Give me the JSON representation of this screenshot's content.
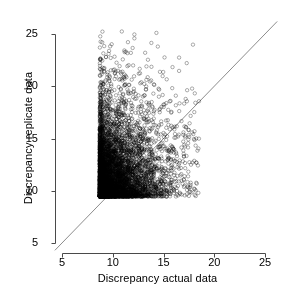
{
  "chart_data": {
    "type": "scatter",
    "title": "",
    "xlabel": "Discrepancy actual data",
    "ylabel": "Discrepancy replicate data",
    "xlim": [
      5,
      25
    ],
    "ylim": [
      5,
      25
    ],
    "xticks": [
      5,
      10,
      15,
      20,
      25
    ],
    "yticks": [
      5,
      10,
      15,
      20,
      25
    ],
    "xticklabels": [
      "5",
      "10",
      "15",
      "20",
      "25"
    ],
    "yticklabels": [
      "5",
      "10",
      "15",
      "20",
      "25"
    ],
    "grid": false,
    "legend": null,
    "marker": {
      "style": "open-circle",
      "radius_px": 1.7,
      "color": "#000000",
      "line_width": 0.6,
      "opacity": 0.55
    },
    "n_points": 6000,
    "point_cloud": {
      "description": "Dense right-skewed bivariate cloud of posterior predictive discrepancy draws",
      "x_center": 10.6,
      "y_center": 12.1,
      "x_sd": 1.85,
      "y_sd": 2.55,
      "correlation": 0.12,
      "x_skew": 0.85,
      "y_skew": 0.75,
      "x_range": [
        6.0,
        18.5
      ],
      "y_range": [
        6.0,
        25.3
      ]
    },
    "reference_line": {
      "label": "identity line y = x",
      "type": "line",
      "slope": 1,
      "intercept": 0,
      "color": "#6f6f6f",
      "width": 0.8,
      "from": [
        4.3,
        4.3
      ],
      "to": [
        26.2,
        26.2
      ]
    },
    "axis": {
      "color": "#4a4a4a",
      "line_width": 1,
      "tick_length_px": 4,
      "style": "detached-L-frame"
    },
    "seed": 20240517
  }
}
